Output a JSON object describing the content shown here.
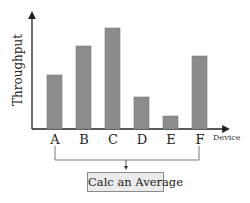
{
  "chart_data": {
    "type": "bar",
    "title": "",
    "xlabel": "Device",
    "ylabel": "Throughput",
    "categories": [
      "A",
      "B",
      "C",
      "D",
      "E",
      "F"
    ],
    "values": [
      54,
      83,
      101,
      32,
      13,
      73
    ],
    "value_units": "relative bar heights (px above baseline); the axis has no numeric scale",
    "grid": false,
    "legend": null,
    "bar_color": "#8c8c8c"
  },
  "diagram": {
    "bracket_from": "A",
    "bracket_to": "F",
    "result_box_label": "Calc an Average"
  },
  "colors": {
    "axis": "#222222",
    "bar_fill": "#8c8c8c",
    "bar_edge": "#7a7a7a",
    "box_fill": "#ebebeb",
    "box_border": "#8a8a8a"
  }
}
